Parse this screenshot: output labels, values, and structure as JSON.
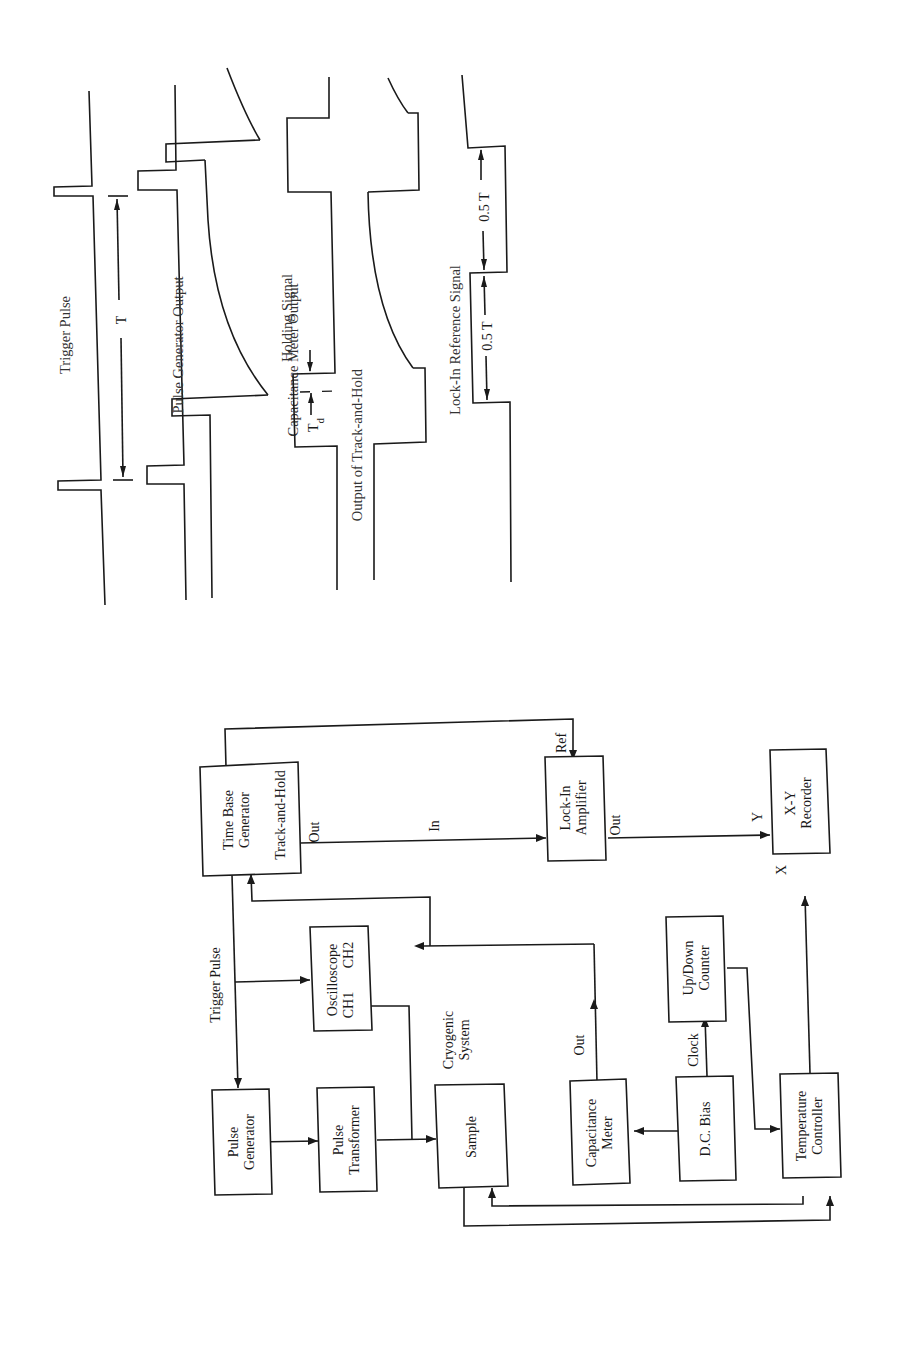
{
  "figure": {
    "orientation": "rotated 90° counter-clockwise",
    "timing_diagram": {
      "waveforms": [
        {
          "id": "trigger",
          "label": "Trigger Pulse"
        },
        {
          "id": "pulse_gen",
          "label": "Pulse Generator Output"
        },
        {
          "id": "cap_meter",
          "label": "Capacitance Meter Output"
        },
        {
          "id": "holding",
          "label": "Holding Signal"
        },
        {
          "id": "track_hold",
          "label": "Output of Track-and-Hold"
        },
        {
          "id": "lockin_ref",
          "label": "Lock-In Reference Signal"
        }
      ],
      "annotations": {
        "period": "T",
        "delay": "T",
        "delay_sub": "d",
        "half_period_1": "0.5 T",
        "half_period_2": "0.5 T"
      }
    },
    "block_diagram": {
      "blocks": {
        "time_base": {
          "line1": "Time Base",
          "line2": "Generator",
          "line3": "Track-and-Hold"
        },
        "lockin": {
          "line1": "Lock-In",
          "line2": "Amplifier"
        },
        "xy": {
          "line1": "X-Y",
          "line2": "Recorder"
        },
        "oscilloscope": {
          "line1": "Oscilloscope",
          "line2": "CH1",
          "line3": "CH2"
        },
        "updown": {
          "line1": "Up/Down",
          "line2": "Counter"
        },
        "pulse_gen": {
          "line1": "Pulse",
          "line2": "Generator"
        },
        "pulse_tr": {
          "line1": "Pulse",
          "line2": "Transformer"
        },
        "sample": {
          "line1": "Sample"
        },
        "cap_meter": {
          "line1": "Capacitance",
          "line2": "Meter"
        },
        "dc_bias": {
          "line1": "D.C. Bias"
        },
        "temp_ctrl": {
          "line1": "Temperature",
          "line2": "Controller"
        }
      },
      "labels": {
        "trigger_pulse": "Trigger Pulse",
        "th_out": "Out",
        "lockin_in": "In",
        "lockin_ref": "Ref",
        "lockin_out": "Out",
        "xy_y": "Y",
        "xy_x": "X",
        "cryo1": "Cryogenic",
        "cryo2": "System",
        "cap_out": "Out",
        "clock": "Clock"
      }
    }
  }
}
